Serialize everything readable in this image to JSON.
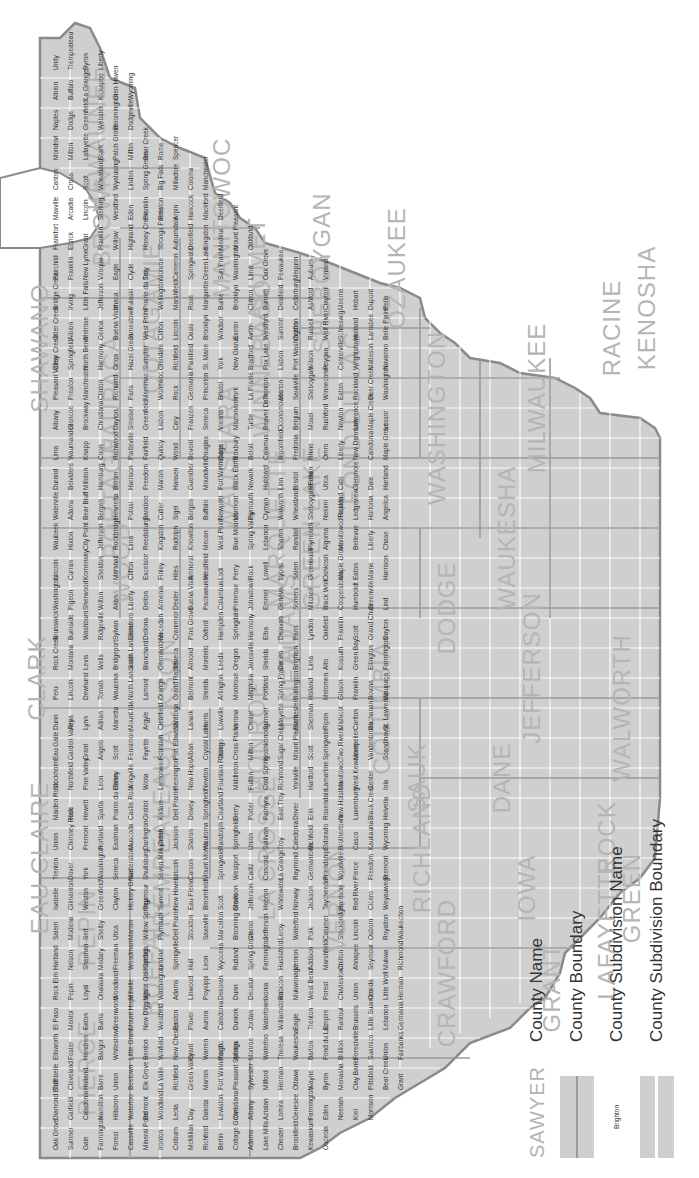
{
  "map": {
    "title": "",
    "region": "Southern Wisconsin county subdivisions",
    "colors": {
      "land_fill": "#cfcfcf",
      "county_boundary": "#9a9a9a",
      "subdivision_boundary": "#ffffff",
      "county_label": "#b5b5b5",
      "subdivision_label": "#333333",
      "coastline": "#8a8a8a",
      "background": "#ffffff"
    },
    "counties": [
      "PIERCE",
      "PEPIN",
      "EAU CLAIRE",
      "CLARK",
      "BUFFALO",
      "TREMPEALEAU",
      "JACKSON",
      "LA CROSSE",
      "MONROE",
      "VERNON",
      "CRAWFORD",
      "RICHLAND",
      "GRANT",
      "IOWA",
      "LAFAYETTE",
      "SAUK",
      "JUNEAU",
      "ADAMS",
      "WOOD",
      "PORTAGE",
      "WAUSHARA",
      "MARQUETTE",
      "GREEN LAKE",
      "COLUMBIA",
      "DANE",
      "GREEN",
      "ROCK",
      "JEFFERSON",
      "DODGE",
      "WALWORTH",
      "WAUKESHA",
      "MILWAUKEE",
      "RACINE",
      "KENOSHA",
      "OZAUKEE",
      "WASHINGTON",
      "SHEBOYGAN",
      "FOND DU LAC",
      "WINNEBAGO",
      "CALUMET",
      "MANITOWOC",
      "KEWAUNEE",
      "BROWN",
      "OUTAGAMIE",
      "WAUPACA",
      "SHAWANO",
      "MARATHON"
    ],
    "county_labels": [
      {
        "name": "PIERCE",
        "x": 110,
        "y": 95
      },
      {
        "name": "PEPIN",
        "x": 250,
        "y": 95
      },
      {
        "name": "EAU CLAIRE",
        "x": 320,
        "y": 48
      },
      {
        "name": "CLARK",
        "x": 500,
        "y": 45
      },
      {
        "name": "BUFFALO",
        "x": 220,
        "y": 160
      },
      {
        "name": "TREMPEALEAU",
        "x": 330,
        "y": 170
      },
      {
        "name": "JACKSON",
        "x": 480,
        "y": 175
      },
      {
        "name": "LA CROSSE",
        "x": 330,
        "y": 275
      },
      {
        "name": "MONROE",
        "x": 440,
        "y": 265
      },
      {
        "name": "VERNON",
        "x": 280,
        "y": 345
      },
      {
        "name": "CRAWFORD",
        "x": 205,
        "y": 455
      },
      {
        "name": "RICHLAND",
        "x": 330,
        "y": 430
      },
      {
        "name": "GRANT",
        "x": 190,
        "y": 560
      },
      {
        "name": "IOWA",
        "x": 290,
        "y": 535
      },
      {
        "name": "LAFAYETTE",
        "x": 250,
        "y": 615
      },
      {
        "name": "SAUK",
        "x": 400,
        "y": 425
      },
      {
        "name": "JUNEAU",
        "x": 495,
        "y": 300
      },
      {
        "name": "ADAMS",
        "x": 560,
        "y": 295
      },
      {
        "name": "WOOD",
        "x": 615,
        "y": 130
      },
      {
        "name": "PORTAGE",
        "x": 680,
        "y": 120
      },
      {
        "name": "WAUSHARA",
        "x": 720,
        "y": 235
      },
      {
        "name": "MARQUETTE",
        "x": 650,
        "y": 285
      },
      {
        "name": "GREEN LAKE",
        "x": 650,
        "y": 320
      },
      {
        "name": "COLUMBIA",
        "x": 470,
        "y": 390
      },
      {
        "name": "DANE",
        "x": 400,
        "y": 510
      },
      {
        "name": "GREEN",
        "x": 280,
        "y": 640
      },
      {
        "name": "ROCK",
        "x": 340,
        "y": 615
      },
      {
        "name": "JEFFERSON",
        "x": 510,
        "y": 540
      },
      {
        "name": "DODGE",
        "x": 570,
        "y": 455
      },
      {
        "name": "WALWORTH",
        "x": 470,
        "y": 630
      },
      {
        "name": "WAUKESHA",
        "x": 640,
        "y": 515
      },
      {
        "name": "MILWAUKEE",
        "x": 780,
        "y": 545
      },
      {
        "name": "RACINE",
        "x": 850,
        "y": 620
      },
      {
        "name": "KENOSHA",
        "x": 870,
        "y": 655
      },
      {
        "name": "OZAUKEE",
        "x": 910,
        "y": 405
      },
      {
        "name": "WASHINGTON",
        "x": 760,
        "y": 445
      },
      {
        "name": "SHEBOYGAN",
        "x": 905,
        "y": 330
      },
      {
        "name": "FOND DU LAC",
        "x": 760,
        "y": 360
      },
      {
        "name": "WINNEBAGO",
        "x": 820,
        "y": 270
      },
      {
        "name": "CALUMET",
        "x": 900,
        "y": 265
      },
      {
        "name": "MANITOWOC",
        "x": 960,
        "y": 230
      },
      {
        "name": "KEWAUNEE",
        "x": 1040,
        "y": 105
      },
      {
        "name": "BROWN",
        "x": 960,
        "y": 110
      },
      {
        "name": "OUTAGAMIE",
        "x": 860,
        "y": 160
      },
      {
        "name": "WAUPACA",
        "x": 780,
        "y": 120
      },
      {
        "name": "SHAWANO",
        "x": 830,
        "y": 48
      }
    ],
    "subdivision_labels_sample": [
      "Oak Grove",
      "Diamond Bluff",
      "Trimbelle",
      "Ellsworth",
      "El Paso",
      "Rock Elm",
      "Hartland",
      "Salem",
      "Isabelle",
      "Trenton",
      "Union",
      "Maiden Rock",
      "Stockholm",
      "Eau Galle",
      "Dunn",
      "Peru",
      "Rock Creek",
      "Brunswick",
      "Washington",
      "Lincoln",
      "Waubeek",
      "Waterville",
      "Durand",
      "Lima",
      "Albany",
      "Pleasant Valley",
      "Clear Creek",
      "Otter Creek",
      "Bridge Creek",
      "Fairchild",
      "Frankfort",
      "Maxville",
      "Canton",
      "Mondovi",
      "Naples",
      "Albion",
      "Unity",
      "Sumner",
      "Garfield",
      "Cleveland",
      "Foster",
      "Mentor",
      "Pepin",
      "Nelson",
      "Modena",
      "Gilmanton",
      "Dover",
      "Chimney Rock",
      "Hale",
      "Northfield",
      "Garden Valley",
      "Alma",
      "Lincoln",
      "Montana",
      "Burnside",
      "Pigeon",
      "Curran",
      "Hixton",
      "Adams",
      "Belvidere",
      "Waumandee",
      "Glencoe",
      "Preston",
      "Springfield",
      "Albion",
      "Irving",
      "Franklin",
      "Ettrick",
      "Arcadia",
      "Cross",
      "Milton",
      "Dodge",
      "Buffalo",
      "Trempealeau",
      "Gale",
      "Caledonia",
      "Holland",
      "Hendren",
      "Eaton",
      "Loyal",
      "Sherman",
      "Seif",
      "Weston",
      "York",
      "Fremont",
      "Hewett",
      "Pine Valley",
      "Grant",
      "Lynn",
      "Dewhurst",
      "Levis",
      "Washburn",
      "Sherwood",
      "Komensky",
      "City Point",
      "Bear Bluff",
      "Millston",
      "Knapp",
      "Brockway",
      "Manchester",
      "North Bend",
      "Melrose",
      "Little Falls",
      "New Lyme",
      "Grant",
      "Lincoln",
      "Scott",
      "Lafayette",
      "Greenfield",
      "La Grange",
      "Byron",
      "Farmington",
      "Hamilton",
      "Barre",
      "Bangor",
      "Burns",
      "Onalaska",
      "Medary",
      "Shelby",
      "Greenfield",
      "Washington",
      "Portland",
      "Sparta",
      "Leon",
      "Angelo",
      "Adrian",
      "Tomah",
      "Wells",
      "Ridgeville",
      "Wilton",
      "Sheldon",
      "Jefferson",
      "Bergen",
      "Hamburg",
      "Coon",
      "Christiana",
      "Clinton",
      "Harmony",
      "Genoa",
      "Jefferson",
      "Viroqua",
      "Franklin",
      "Sterling",
      "Wheatland",
      "Stark",
      "Webster",
      "Kickapoo",
      "Liberty",
      "Forest",
      "Hillsboro",
      "Union",
      "Whitestown",
      "Greenwood",
      "Woodland",
      "Freeman",
      "Utica",
      "Clayton",
      "Seneca",
      "Eastman",
      "Prairie du Chien",
      "Haney",
      "Scott",
      "Marietta",
      "Wauzeka",
      "Bridgeport",
      "Sylvan",
      "Akan",
      "Marshall",
      "Rockbridge",
      "Henrietta",
      "Bloom",
      "Richwood",
      "Dayton",
      "Richland",
      "Orion",
      "Buena Vista",
      "Ithaca",
      "Eagle",
      "Willow",
      "Westford",
      "Wyalusing",
      "Patch Grove",
      "Bloomington",
      "Glen Haven",
      "Cassville",
      "Waterloo",
      "Beetown",
      "Little Grant",
      "Mount Hope",
      "Millville",
      "Woodman",
      "Marion",
      "Hickory Grove",
      "Watterstown",
      "Muscoda",
      "Castle Rock",
      "Wingville",
      "Fennimore",
      "Mount Ida",
      "North Lancaster",
      "South Lancaster",
      "Ellenboro",
      "Liberty",
      "Clifton",
      "Lima",
      "Potosi",
      "Harrison",
      "Platteville",
      "Smelser",
      "Paris",
      "Hazel Green",
      "Jamestown",
      "Pulaski",
      "Clyde",
      "Highland",
      "Eden",
      "Linden",
      "Mifflin",
      "Dodgeville",
      "Wyoming",
      "Mineral Point",
      "Belmont",
      "Elk Grove",
      "Benton",
      "New Diggings",
      "White Oak Springs",
      "Kendall",
      "Willow Springs",
      "Seymour",
      "Shullsburg",
      "Darlington",
      "Gratiot",
      "Wiota",
      "Fayette",
      "Argyle",
      "Lamont",
      "Blanchard",
      "Dellona",
      "Delton",
      "Excelsior",
      "Reedsburg",
      "Baraboo",
      "Freedom",
      "Fairfield",
      "Greenfield",
      "Merrimac",
      "Sumpter",
      "West Point",
      "Prairie du Sac",
      "Troy",
      "Honey Creek",
      "Franklin",
      "Spring Green",
      "Bear Creek",
      "Ironton",
      "Woodland",
      "La Valle",
      "Winfield",
      "Westfield",
      "Washington",
      "Lindina",
      "Plymouth",
      "Summit",
      "Seven Mile Creek",
      "Lyndon",
      "Kildare",
      "Lemonweir",
      "Fountain",
      "Clearfield",
      "Orange",
      "Germantown",
      "Necedah",
      "Armenia",
      "Finley",
      "Kingston",
      "Cutler",
      "Marion",
      "Quincy",
      "Lisbon",
      "Wonewoc",
      "Glendale",
      "Clifton",
      "Wellington",
      "Monroe",
      "Strongs Prairie",
      "Preston",
      "Big Flats",
      "Rome",
      "Colburn",
      "Leola",
      "Richfield",
      "New Chester",
      "Easton",
      "Adams",
      "Springville",
      "Dell Prairie",
      "New Haven",
      "Lincoln",
      "Jackson",
      "Dell Prairie",
      "Remington",
      "Port Edwards",
      "Saratoga",
      "Grand Rapids",
      "Seneca",
      "Cranmoor",
      "Dexter",
      "Hiles",
      "Rudolph",
      "Sigel",
      "Hansen",
      "Wood",
      "Cary",
      "Rock",
      "Richfield",
      "Lincoln",
      "Marshfield",
      "Cameron",
      "Auburndale",
      "Arpin",
      "Milladore",
      "Spencer",
      "McMillan",
      "Day",
      "Green Valley",
      "Grant",
      "Plover",
      "Linwood",
      "Hull",
      "Stockton",
      "Eau Pleine",
      "Carson",
      "Sharon",
      "Dewey",
      "New Hope",
      "Alban",
      "Lanark",
      "Belmont",
      "Almond",
      "Pine Grove",
      "Buena Vista",
      "Amherst",
      "Knowlton",
      "Bergen",
      "Guenther",
      "Bevent",
      "Franzen",
      "Germania",
      "Plainfield",
      "Oasis",
      "Rose",
      "Springwater",
      "Deerfield",
      "Hancock",
      "Coloma",
      "Richford",
      "Dakota",
      "Marion",
      "Warren",
      "Aurora",
      "Poysippi",
      "Leon",
      "Saxeville",
      "Bloomfield",
      "Mount Morris",
      "Wautoma",
      "Springfield",
      "Newton",
      "Crystal Lake",
      "Harris",
      "Shields",
      "Montello",
      "Oxford",
      "Packwaukee",
      "Westfield",
      "Mecan",
      "Buffalo",
      "Moundville",
      "Douglas",
      "Seneca",
      "Princeton",
      "St. Marie",
      "Brooklyn",
      "Marquette",
      "Green Lake",
      "Kingston",
      "Mackford",
      "Manchester",
      "Berlin",
      "Lewiston",
      "Fort Winnebago",
      "Pacific",
      "Caledonia",
      "Dekorah",
      "Wyocena",
      "Marcellon",
      "Scott",
      "Springvale",
      "Randolph",
      "Courtland",
      "Fountain Prairie",
      "Otsego",
      "Lowville",
      "Arlington",
      "Leeds",
      "Hampden",
      "Columbus",
      "Lodi",
      "West Point",
      "Newport",
      "Fort Winnebago",
      "Dane",
      "Vienna",
      "Bristol",
      "York",
      "Windsor",
      "Burke",
      "Sun Prairie",
      "Medina",
      "Deerfield",
      "Cottage Grove",
      "Christiana",
      "Pleasant Springs",
      "Albion",
      "Dunkirk",
      "Dunn",
      "Rutland",
      "Blooming Grove",
      "Madison",
      "Westport",
      "Springfield",
      "Berry",
      "Middleton",
      "Cross Plains",
      "Verona",
      "Montrose",
      "Oregon",
      "Springdale",
      "Primrose",
      "Perry",
      "Blue Mounds",
      "Vermont",
      "Black Earth",
      "Roxbury",
      "Mazomanie",
      "York",
      "New Glarus",
      "Exeter",
      "Brooklyn",
      "Washington",
      "Mount Pleasant",
      "Adams",
      "Albany",
      "Sylvester",
      "Monroe",
      "Jordan",
      "Decatur",
      "Spring Grove",
      "Clarno",
      "Jefferson",
      "Cadiz",
      "Union",
      "Porter",
      "Fulton",
      "Milton",
      "Center",
      "Magnolia",
      "Janesville",
      "Harmony",
      "Johnstown",
      "Rock",
      "Spring Valley",
      "Plymouth",
      "Newark",
      "Beloit",
      "Turtle",
      "La Prairie",
      "Bradford",
      "Avon",
      "Clinton",
      "Lima",
      "Oakland",
      "Lake Mills",
      "Aztalan",
      "Milford",
      "Waterloo",
      "Watertown",
      "Ixonia",
      "Farmington",
      "Jefferson",
      "Hebron",
      "Concord",
      "Sullivan",
      "Palmyra",
      "Cold Spring",
      "Koshkonong",
      "Sumner",
      "Portland",
      "Shields",
      "Elba",
      "Emmet",
      "Lowell",
      "Lebanon",
      "Clyman",
      "Hubbard",
      "Calamus",
      "Beaver Dam",
      "Trenton",
      "Fox Lake",
      "Westford",
      "Burnett",
      "Oak Grove",
      "Chester",
      "Lomira",
      "Herman",
      "Theresa",
      "Williamstown",
      "Rubicon",
      "Hustisford",
      "Leroy",
      "Whitewater",
      "La Grange",
      "Troy",
      "East Troy",
      "Richmond",
      "Sugar Creek",
      "Lafayette",
      "Spring Prairie",
      "Darien",
      "Delavan",
      "Geneva",
      "Lyons",
      "Sharon",
      "Walworth",
      "Linn",
      "Bloomfield",
      "Oconomowoc",
      "Merton",
      "Lisbon",
      "Summit",
      "Delafield",
      "Pewaukee",
      "Brookfield",
      "Genesee",
      "Ottawa",
      "Waukesha",
      "Eagle",
      "Mukwonago",
      "Vernon",
      "Waterford",
      "Norway",
      "Raymond",
      "Caledonia",
      "Dover",
      "Yorkville",
      "Mount Pleasant",
      "Rochester",
      "Burlington",
      "Brighton",
      "Paris",
      "Somers",
      "Salem",
      "Randall",
      "Wheatland",
      "Bristol",
      "Fredonia",
      "Belgium",
      "Saukville",
      "Port Washington",
      "Grafton",
      "Cedarburg",
      "Mequon",
      "Kewaskum",
      "Farmington",
      "Wayne",
      "Barton",
      "Trenton",
      "West Bend",
      "Addison",
      "Polk",
      "Jackson",
      "Germantown",
      "Richfield",
      "Erin",
      "Hartford",
      "Scott",
      "Sherman",
      "Holland",
      "Lima",
      "Lyndon",
      "Mitchell",
      "Greenbush",
      "Plymouth",
      "Sheboygan Falls",
      "Herman",
      "Rhine",
      "Mosel",
      "Sheboygan",
      "Wilson",
      "Russell",
      "Ashford",
      "Auburn",
      "Osceola",
      "Eden",
      "Byron",
      "Fond du Lac",
      "Empire",
      "Forest",
      "Marshfield",
      "Calumet",
      "Taycheedah",
      "Friendship",
      "Eldorado",
      "Rosendale",
      "Lamartine",
      "Springvale",
      "Ripon",
      "Metomen",
      "Alto",
      "Oakfield",
      "Black Wolf",
      "Oshkosh",
      "Algoma",
      "Nekimi",
      "Utica",
      "Omro",
      "Rushford",
      "Winneconne",
      "Poygan",
      "Wolf River",
      "Clayton",
      "Vinland",
      "Neenah",
      "Menasha",
      "Brillion",
      "Rantoul",
      "Charlestown",
      "Chilton",
      "Stockbridge",
      "Harrison",
      "Woodville",
      "Brothertown",
      "New Holstein",
      "Manitowoc",
      "Two Rivers",
      "Mishicot",
      "Gibson",
      "Kossuth",
      "Franklin",
      "Cooperstown",
      "Maple Grove",
      "Manitowoc Rapids",
      "Rockland",
      "Cato",
      "Liberty",
      "Newton",
      "Eaton",
      "Centerville",
      "Schleswig",
      "Meeme",
      "Kiel",
      "Clay Banks",
      "Forestville",
      "Brussels",
      "Union",
      "Ahnapee",
      "Lincoln",
      "Red River",
      "Pierce",
      "Casco",
      "Luxemburg",
      "West Kewaunee",
      "Montpelier",
      "Carlton",
      "Franklin",
      "Green Bay",
      "Scott",
      "Humboldt",
      "Eaton",
      "Bellevue",
      "Ledgeview",
      "Glenmore",
      "New Denmark",
      "Lawrence",
      "Rockland",
      "Wrightstown",
      "Holland",
      "Hobart",
      "Morrison",
      "Pittsfield",
      "Suamico",
      "Little Suamico",
      "Oneida",
      "Seymour",
      "Osborn",
      "Cicero",
      "Freedom",
      "Kaukauna",
      "Black Creek",
      "Center",
      "Vandenbroek",
      "Buchanan",
      "Bovina",
      "Ellington",
      "Grand Chute",
      "Greenville",
      "Maine",
      "Liberty",
      "Hortonia",
      "Dale",
      "Caledonia",
      "Maple Creek",
      "Deer Creek",
      "Matteson",
      "Larrabee",
      "Dupont",
      "Bear Creek",
      "Union",
      "Lebanon",
      "Little Wolf",
      "Mukwa",
      "Royalton",
      "Weyauwega",
      "Fremont",
      "Wyoming",
      "Helvetia",
      "Iola",
      "Scandinavia",
      "St. Lawrence",
      "Waupaca",
      "Farmington",
      "Dayton",
      "Lind",
      "Harrison",
      "Chase",
      "Angelica",
      "Hartland",
      "Maple Grove",
      "Lessor",
      "Washington",
      "Navarino",
      "Belle Plaine",
      "Pella",
      "Grant",
      "Fairbanks",
      "Germania",
      "Herman",
      "Richmond",
      "Waukechon"
    ]
  },
  "legend": {
    "items": [
      {
        "swatch_text": "SAWYER",
        "label": "County Name"
      },
      {
        "swatch_text": "",
        "label": "County Boundary"
      },
      {
        "swatch_text": "Brighton",
        "label": "County Subdivision Name"
      },
      {
        "swatch_text": "",
        "label": "County Subdivision Boundary"
      }
    ]
  }
}
